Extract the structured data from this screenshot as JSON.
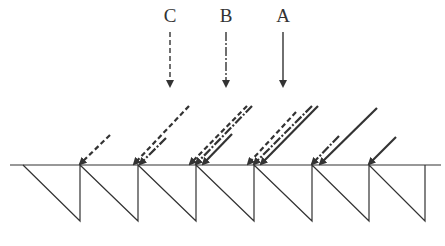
{
  "colors": {
    "ink": "#333333",
    "background": "#ffffff"
  },
  "labels": [
    {
      "id": "C",
      "text": "C",
      "x": 170,
      "style": "dashed"
    },
    {
      "id": "B",
      "text": "B",
      "x": 226,
      "style": "dash-dot"
    },
    {
      "id": "A",
      "text": "A",
      "x": 283,
      "style": "solid"
    }
  ],
  "baseline": {
    "y": 165,
    "x1": 10,
    "x2": 441
  },
  "sawtooth": {
    "start_x": 23,
    "bottom_y": 221,
    "peaks_x": [
      80,
      138,
      196,
      254,
      312,
      369,
      425
    ]
  },
  "incident_arrows": [
    {
      "tip_x": 80,
      "from": [
        110,
        135
      ],
      "style": "dashed"
    },
    {
      "tip_x": 134,
      "from": [
        189,
        106
      ],
      "style": "dashed"
    },
    {
      "tip_x": 140,
      "from": [
        166,
        138
      ],
      "style": "dash-dot"
    },
    {
      "tip_x": 190,
      "from": [
        247,
        106
      ],
      "style": "dashed"
    },
    {
      "tip_x": 196,
      "from": [
        252,
        106
      ],
      "style": "dash-dot"
    },
    {
      "tip_x": 203,
      "from": [
        232,
        134
      ],
      "style": "solid"
    },
    {
      "tip_x": 248,
      "from": [
        296,
        112
      ],
      "style": "dashed"
    },
    {
      "tip_x": 254,
      "from": [
        312,
        106
      ],
      "style": "dash-dot"
    },
    {
      "tip_x": 261,
      "from": [
        318,
        106
      ],
      "style": "solid"
    },
    {
      "tip_x": 312,
      "from": [
        339,
        136
      ],
      "style": "dash-dot"
    },
    {
      "tip_x": 320,
      "from": [
        377,
        108
      ],
      "style": "solid"
    },
    {
      "tip_x": 369,
      "from": [
        396,
        137
      ],
      "style": "solid"
    }
  ]
}
